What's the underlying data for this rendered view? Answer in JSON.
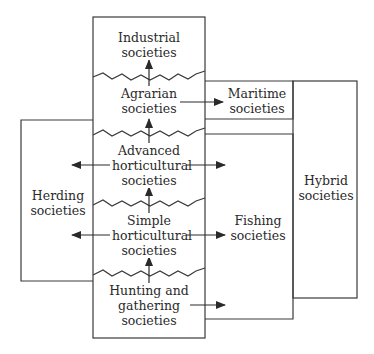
{
  "diagram": {
    "type": "societal-evolution-flow",
    "stages": [
      {
        "id": "industrial",
        "label": "Industrial\nsocieties"
      },
      {
        "id": "agrarian",
        "label": "Agrarian\nsocieties"
      },
      {
        "id": "advanced_horticultural",
        "label": "Advanced\nhorticultural\nsocieties"
      },
      {
        "id": "simple_horticultural",
        "label": "Simple\nhorticultural\nsocieties"
      },
      {
        "id": "hunting_gathering",
        "label": "Hunting and\ngathering\nsocieties"
      }
    ],
    "side_types": [
      {
        "id": "maritime",
        "label": "Maritime\nsocieties"
      },
      {
        "id": "herding",
        "label": "Herding\nsocieties"
      },
      {
        "id": "fishing",
        "label": "Fishing\nsocieties"
      },
      {
        "id": "hybrid",
        "label": "Hybrid\nsocieties"
      }
    ],
    "edges": [
      {
        "from": "hunting_gathering",
        "to": "simple_horticultural"
      },
      {
        "from": "simple_horticultural",
        "to": "advanced_horticultural"
      },
      {
        "from": "advanced_horticultural",
        "to": "agrarian"
      },
      {
        "from": "agrarian",
        "to": "industrial"
      },
      {
        "from": "agrarian",
        "to": "maritime"
      },
      {
        "from": "advanced_horticultural",
        "to": "herding"
      },
      {
        "from": "advanced_horticultural",
        "to": "fishing"
      },
      {
        "from": "simple_horticultural",
        "to": "herding"
      },
      {
        "from": "simple_horticultural",
        "to": "fishing"
      },
      {
        "from": "hunting_gathering",
        "to": "fishing"
      }
    ],
    "colors": {
      "line": "#3a3a3a",
      "text": "#2a2a2a",
      "background": "#ffffff"
    }
  }
}
